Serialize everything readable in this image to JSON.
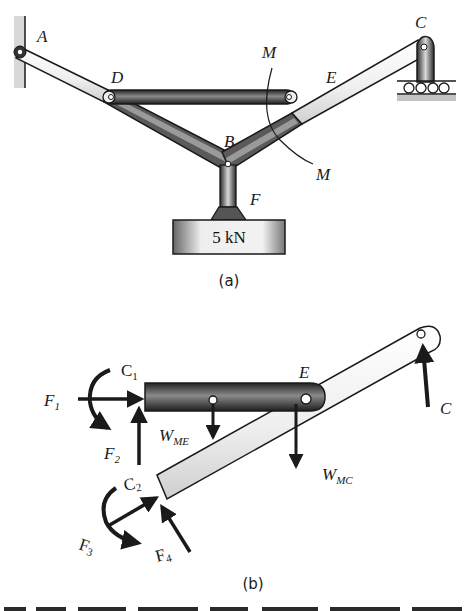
{
  "figure_a": {
    "caption": "(a)",
    "labels": {
      "A": "A",
      "B": "B",
      "C": "C",
      "D": "D",
      "E": "E",
      "F": "F",
      "M_top": "M",
      "M_bottom": "M"
    },
    "load_label": "5 kN"
  },
  "figure_b": {
    "caption": "(b)",
    "labels": {
      "C1_main": "C",
      "C1_sub": "1",
      "C2_main": "C",
      "C2_sub": "2",
      "F1_main": "F",
      "F1_sub": "1",
      "F2_main": "F",
      "F2_sub": "2",
      "F3_main": "F",
      "F3_sub": "3",
      "F4_main": "F",
      "F4_sub": "4",
      "E": "E",
      "C": "C",
      "WME_main": "W",
      "WME_sub": "ME",
      "WMC_main": "W",
      "WMC_sub": "MC"
    }
  },
  "colors": {
    "ink": "#1a1a1a",
    "member_dark": "#3a3a3a",
    "member_light": "#e4e4e4",
    "ground": "#bdbdbd"
  }
}
